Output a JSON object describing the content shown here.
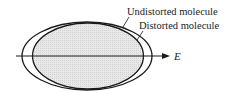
{
  "diagram": {
    "labels": {
      "undistorted": "Undistorted molecule",
      "distorted": "Distorted molecule",
      "field": "E"
    },
    "colors": {
      "stroke": "#1a1a1a",
      "fill_inner": "#e4e4e4",
      "background": "#ffffff"
    }
  }
}
